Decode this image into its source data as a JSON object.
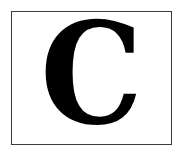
{
  "letter": "C",
  "colors": {
    "border": "#3a3a3a",
    "letter": "#000000",
    "background": "#ffffff"
  }
}
